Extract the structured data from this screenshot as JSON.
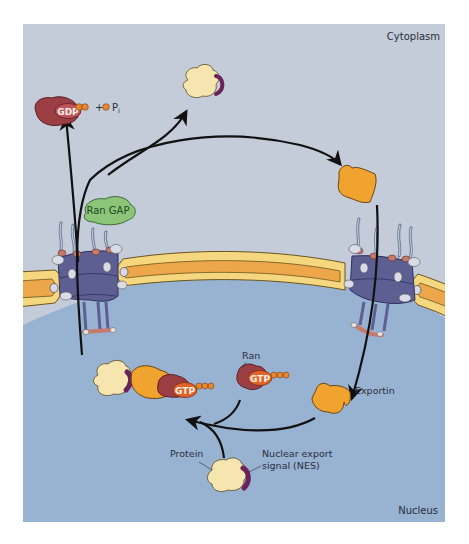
{
  "figure": {
    "regions": {
      "top": "Cytoplasm",
      "bottom": "Nucleus"
    },
    "labels": {
      "ran_gap": "Ran GAP",
      "gdp": "GDP",
      "plus": "+",
      "pi_main": "P",
      "pi_sub": "i",
      "gtp_complex": "GTP",
      "gtp_free": "GTP",
      "ran": "Ran",
      "exportin": "Exportin",
      "protein": "Protein",
      "nes_line1": "Nuclear export",
      "nes_line2": "signal (NES)"
    },
    "colors": {
      "cytoplasm_bg": "#c3ccd8",
      "nucleus_bg": "#98b2d2",
      "membrane_outer": "#f5d77f",
      "membrane_inner": "#eea64a",
      "pore_body": "#5d5f92",
      "ran": "#9c3f45",
      "gtp_badge": "#e2632a",
      "phosphate": "#e88730",
      "exportin": "#f0a42f",
      "cargo": "#f7e5b0",
      "nes": "#6a2358",
      "ran_gap": "#8cc57a",
      "arrow": "#111111"
    }
  }
}
